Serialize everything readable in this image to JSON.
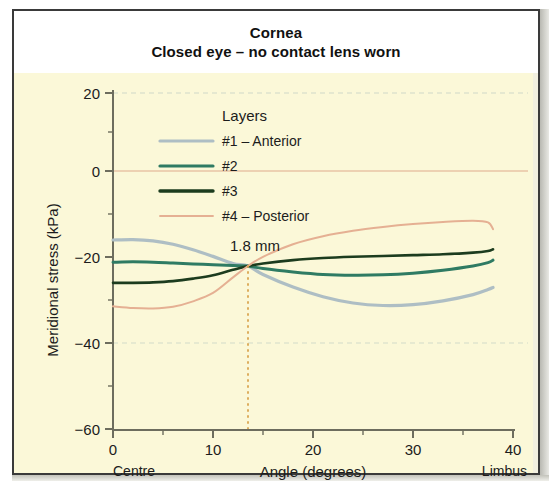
{
  "figure": {
    "title_line1": "Cornea",
    "title_line2": "Closed eye – no contact lens worn"
  },
  "legend": {
    "title": "Layers",
    "items": [
      {
        "label": "#1 – Anterior",
        "color": "#aebec4"
      },
      {
        "label": "#2",
        "color": "#2f7b63"
      },
      {
        "label": "#3",
        "color": "#1c3c1e"
      },
      {
        "label": "#4 – Posterior",
        "color": "#e5b093"
      }
    ]
  },
  "annotations": {
    "crossing_label": "1.8 mm",
    "crossing_x_deg": 13.5,
    "crossing_y_kpa": -21.0
  },
  "axes": {
    "x_label": "Angle (degrees)",
    "x_ticks": [
      "0",
      "10",
      "20",
      "30",
      "40"
    ],
    "x_left_end_label": "Centre",
    "x_right_end_label": "Limbus",
    "y_label": "Meridional stress (kPa)",
    "y_ticks": [
      "20",
      "0",
      "−20",
      "−40",
      "−60"
    ]
  },
  "chart_data": {
    "type": "line",
    "xlabel": "Angle (degrees)",
    "ylabel": "Meridional stress (kPa)",
    "xlim": [
      0,
      40
    ],
    "ylim": [
      -60,
      20
    ],
    "x_ticks": [
      0,
      10,
      20,
      30,
      40
    ],
    "y_ticks": [
      20,
      0,
      -20,
      -40,
      -60
    ],
    "x_minor_ticks": [
      5,
      15,
      25,
      35
    ],
    "y_minor_ticks": [
      10,
      -10,
      -30,
      -50
    ],
    "grid": "horizontal-dashed-at-20-and-minus-40",
    "zero_line": true,
    "legend_position": "upper-left-inside",
    "annotations": [
      {
        "text": "1.8 mm",
        "x": 13.5,
        "y": -21.0,
        "type": "vertical-dotted-line-with-label",
        "color": "#d8a24a"
      }
    ],
    "x": [
      0,
      2,
      4,
      6,
      8,
      10,
      12,
      13.5,
      15,
      18,
      21,
      24,
      27,
      30,
      33,
      36,
      37.5,
      38
    ],
    "series": [
      {
        "name": "#1 – Anterior",
        "color": "#aebec4",
        "values": [
          -15.0,
          -14.9,
          -15.2,
          -16.0,
          -17.3,
          -18.9,
          -20.6,
          -21.2,
          -23.2,
          -26.2,
          -28.5,
          -30.0,
          -30.6,
          -30.4,
          -29.5,
          -28.0,
          -26.8,
          -26.3
        ]
      },
      {
        "name": "#2",
        "color": "#2f7b63",
        "values": [
          -20.3,
          -20.2,
          -20.3,
          -20.5,
          -20.7,
          -20.9,
          -21.1,
          -21.2,
          -21.8,
          -22.6,
          -23.2,
          -23.4,
          -23.3,
          -22.9,
          -22.2,
          -21.2,
          -20.4,
          -19.8
        ]
      },
      {
        "name": "#3",
        "color": "#1c3c1e",
        "values": [
          -25.2,
          -25.2,
          -25.1,
          -24.8,
          -24.2,
          -23.4,
          -22.1,
          -21.2,
          -20.6,
          -19.8,
          -19.3,
          -19.0,
          -18.8,
          -18.6,
          -18.4,
          -18.0,
          -17.6,
          -17.2
        ]
      },
      {
        "name": "#4 – Posterior",
        "color": "#e5b093",
        "values": [
          -30.8,
          -31.2,
          -31.3,
          -30.9,
          -29.6,
          -27.6,
          -23.9,
          -21.2,
          -19.0,
          -16.0,
          -14.1,
          -12.8,
          -11.9,
          -11.2,
          -10.7,
          -10.4,
          -10.8,
          -12.4
        ]
      }
    ]
  }
}
